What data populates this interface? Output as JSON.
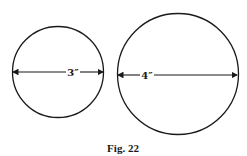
{
  "figure": {
    "caption": "Fig. 22",
    "circles": [
      {
        "id": "small",
        "diameter_label": "3″",
        "diameter_value": 3,
        "unit": "ft"
      },
      {
        "id": "large",
        "diameter_label": "4″",
        "diameter_value": 4,
        "unit": "ft"
      }
    ],
    "stroke_color": "#1a1a1a",
    "background": "#ffffff"
  }
}
